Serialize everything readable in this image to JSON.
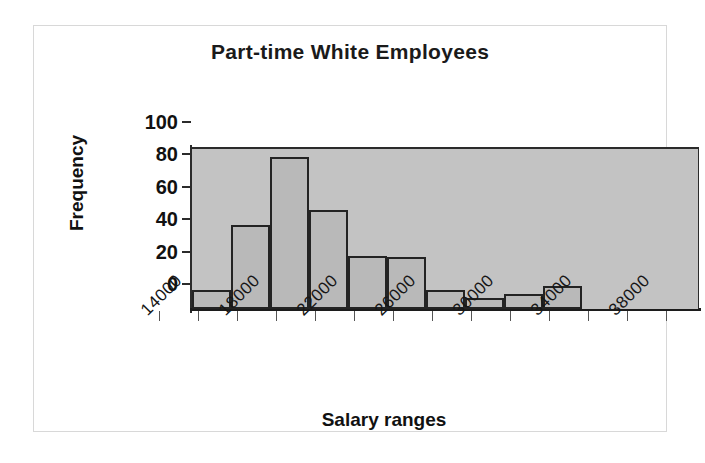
{
  "chart_data": {
    "type": "bar",
    "title": "Part-time White Employees",
    "xlabel": "Salary ranges",
    "ylabel": "Frequency",
    "ylim": [
      0,
      100
    ],
    "yticks": [
      0,
      20,
      40,
      60,
      80,
      100
    ],
    "grid": false,
    "legend": null,
    "bin_width": 2000,
    "categories": [
      "14000",
      "16000",
      "18000",
      "20000",
      "22000",
      "24000",
      "26000",
      "28000",
      "30000",
      "32000",
      "34000",
      "36000",
      "38000"
    ],
    "tick_labels": [
      "14000",
      "18000",
      "22000",
      "26000",
      "30000",
      "34000",
      "38000"
    ],
    "values": [
      12,
      52,
      94,
      61,
      33,
      32,
      12,
      7,
      9,
      14,
      0,
      0,
      0
    ],
    "series": [
      {
        "name": "Frequency",
        "values": [
          12,
          52,
          94,
          61,
          33,
          32,
          12,
          7,
          9,
          14,
          0,
          0,
          0
        ]
      }
    ],
    "colors": {
      "bar_fill": "#b9b9b9",
      "bar_edge": "#232323",
      "plot_background": "#c3c3c3",
      "axis": "#2b2b2b",
      "text": "#111111",
      "frame": "#d8d8d8"
    }
  }
}
